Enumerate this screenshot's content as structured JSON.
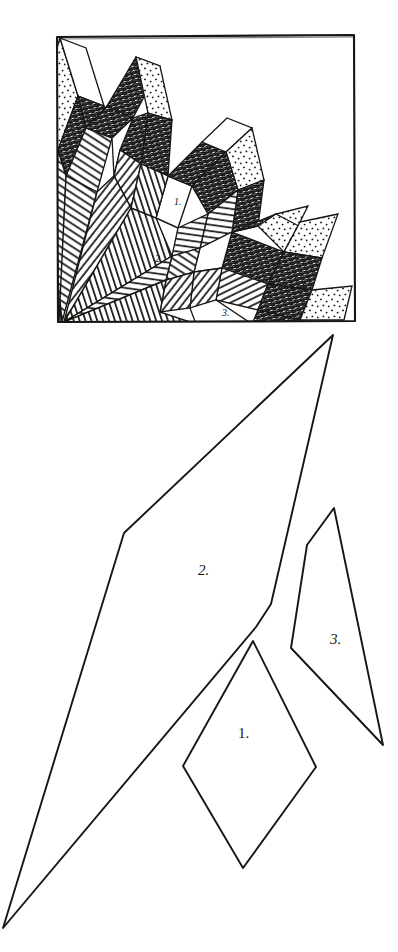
{
  "figure": {
    "kind": "hand-drawn-geometric-tiling-figure",
    "background_color": "#ffffff",
    "ink_color": "#181513",
    "panels": [
      {
        "id": "tiling-panel",
        "name": "framed-tiling-pattern",
        "frame": {
          "x": 56,
          "y": 35,
          "width": 299,
          "height": 287
        },
        "description": "Square frame containing a pinwheel/spiral tiling of three prototile shapes, filled with stipple, dark scribble hatch, and line hatch.",
        "labels": [
          {
            "text": "1.",
            "x": 174,
            "y": 205,
            "size": 10
          },
          {
            "text": "2.",
            "x": 155,
            "y": 262,
            "size": 10
          },
          {
            "text": "3.",
            "x": 222,
            "y": 316,
            "size": 10
          }
        ]
      },
      {
        "id": "prototiles-panel",
        "name": "prototile-outlines",
        "description": "Three unfilled prototile outlines drawn at large scale: a rhombus (1), a long thin quadrilateral (2) and a narrow kite (3).",
        "labels": [
          {
            "text": "1.",
            "x": 248,
            "y": 738,
            "size": 15
          },
          {
            "text": "2.",
            "x": 198,
            "y": 575,
            "size": 15
          },
          {
            "text": "3.",
            "x": 330,
            "y": 644,
            "size": 15
          }
        ]
      }
    ],
    "fill_styles": [
      {
        "name": "stipple",
        "label": "dotted / stippled",
        "color": "#1a1715"
      },
      {
        "name": "dark-scribble",
        "label": "dense dark scribble hatch",
        "color": "#141210"
      },
      {
        "name": "line-hatch",
        "label": "parallel line hatch",
        "color": "#171513"
      },
      {
        "name": "blank",
        "label": "unfilled white",
        "color": "#ffffff"
      }
    ],
    "prototiles": [
      {
        "number": "1.",
        "name": "rhombus-tile",
        "vertices": [
          [
            253,
            641
          ],
          [
            316,
            767
          ],
          [
            243,
            868
          ],
          [
            183,
            766
          ]
        ]
      },
      {
        "number": "2.",
        "name": "long-thin-quadrilateral-tile",
        "vertices": [
          [
            333,
            335
          ],
          [
            271,
            604
          ],
          [
            256,
            627
          ],
          [
            3,
            928
          ],
          [
            124,
            533
          ]
        ]
      },
      {
        "number": "3.",
        "name": "narrow-kite-tile",
        "vertices": [
          [
            334,
            508
          ],
          [
            383,
            745
          ],
          [
            291,
            648
          ],
          [
            307,
            545
          ]
        ]
      }
    ]
  }
}
